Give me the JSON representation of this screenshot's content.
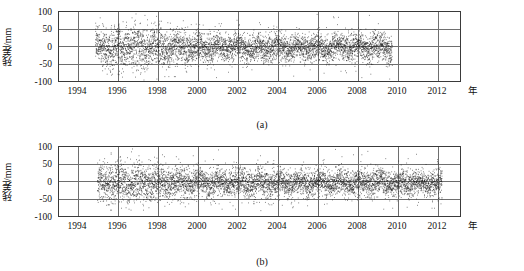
{
  "figure": {
    "background_color": "#ffffff",
    "axis_color": "#3a3a3a",
    "grid_color": "#6e6e6e",
    "point_color": "#1a1a1a"
  },
  "panels": [
    {
      "id": "a",
      "caption": "(a)",
      "ylabel": "残差/mm",
      "xunit": "年",
      "yticks": [
        "100",
        "50",
        "0",
        "-50",
        "-100"
      ],
      "xticks": [
        "1994",
        "1996",
        "1998",
        "2000",
        "2002",
        "2004",
        "2006",
        "2008",
        "2010",
        "2012"
      ]
    },
    {
      "id": "b",
      "caption": "(b)",
      "ylabel": "残差/mm",
      "xunit": "年",
      "yticks": [
        "100",
        "50",
        "0",
        "-50",
        "-100"
      ],
      "xticks": [
        "1994",
        "1996",
        "1998",
        "2000",
        "2002",
        "2004",
        "2006",
        "2008",
        "2010",
        "2012"
      ]
    }
  ],
  "chart_data": [
    {
      "type": "scatter",
      "panel": "a",
      "title": "",
      "subtitle": "(a)",
      "xlabel": "年",
      "ylabel": "残差/mm",
      "xlim": [
        1993,
        2013
      ],
      "ylim": [
        -100,
        100
      ],
      "xticks": [
        1994,
        1996,
        1998,
        2000,
        2002,
        2004,
        2006,
        2008,
        2010,
        2012
      ],
      "yticks": [
        -100,
        -50,
        0,
        50,
        100
      ],
      "grid": true,
      "legend": "none",
      "point_color": "#1a1a1a",
      "point_size_px": 1,
      "data_span": [
        1994.8,
        1909.6
      ],
      "series": [
        {
          "name": "残差",
          "description": "GPS coordinate time-series residuals, dense daily scatter from 1994.8 to 2009.6, centred near 0 mm, bulk of points within -50 to +50 mm, sparse outliers reaching +-100 mm.",
          "x_start": 1994.8,
          "x_end": 2009.6,
          "n_points_approx": 5200,
          "mean": -3,
          "std_dev": 22,
          "outlier_fraction": 0.04,
          "seasonal_amplitude": 14,
          "seasonal_period_years": 1,
          "envelope_by_epoch": [
            {
              "year": 1994.8,
              "std": 26
            },
            {
              "year": 1996.0,
              "std": 30
            },
            {
              "year": 1997.0,
              "std": 31
            },
            {
              "year": 1998.0,
              "std": 28
            },
            {
              "year": 1999.0,
              "std": 25
            },
            {
              "year": 2000.0,
              "std": 22
            },
            {
              "year": 2002.0,
              "std": 20
            },
            {
              "year": 2004.0,
              "std": 19
            },
            {
              "year": 2006.0,
              "std": 19
            },
            {
              "year": 2008.0,
              "std": 20
            },
            {
              "year": 2009.6,
              "std": 20
            }
          ]
        }
      ]
    },
    {
      "type": "scatter",
      "panel": "b",
      "title": "",
      "subtitle": "(b)",
      "xlabel": "年",
      "ylabel": "残差/mm",
      "xlim": [
        1993,
        2013
      ],
      "ylim": [
        -100,
        100
      ],
      "xticks": [
        1994,
        1996,
        1998,
        2000,
        2002,
        2004,
        2006,
        2008,
        2010,
        2012
      ],
      "yticks": [
        -100,
        -50,
        0,
        50,
        100
      ],
      "grid": true,
      "legend": "none",
      "point_color": "#1a1a1a",
      "point_size_px": 1,
      "data_span": [
        1994.9,
        2012.1
      ],
      "series": [
        {
          "name": "残差",
          "description": "GPS coordinate time-series residuals, dense daily scatter from 1994.9 to 2012.1, centred near 0 mm, bulk of points within -50 to +50 mm, sparse outliers reaching +-100 mm.",
          "x_start": 1994.9,
          "x_end": 2012.1,
          "n_points_approx": 6000,
          "mean": -4,
          "std_dev": 21,
          "outlier_fraction": 0.04,
          "seasonal_amplitude": 13,
          "seasonal_period_years": 1,
          "envelope_by_epoch": [
            {
              "year": 1994.9,
              "std": 24
            },
            {
              "year": 1996.0,
              "std": 30
            },
            {
              "year": 1997.0,
              "std": 28
            },
            {
              "year": 1998.0,
              "std": 23
            },
            {
              "year": 2000.0,
              "std": 21
            },
            {
              "year": 2002.0,
              "std": 20
            },
            {
              "year": 2004.0,
              "std": 19
            },
            {
              "year": 2006.0,
              "std": 19
            },
            {
              "year": 2008.0,
              "std": 19
            },
            {
              "year": 2010.0,
              "std": 19
            },
            {
              "year": 2012.1,
              "std": 19
            }
          ]
        }
      ]
    }
  ]
}
